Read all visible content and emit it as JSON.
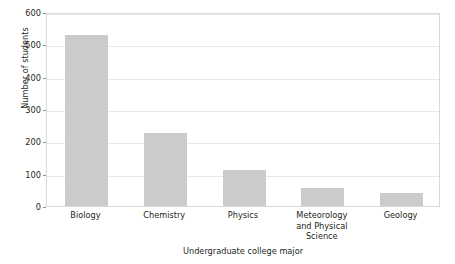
{
  "chart_data": {
    "type": "bar",
    "title": "",
    "xlabel": "Undergraduate college major",
    "ylabel": "Number of students",
    "categories": [
      "Biology",
      "Chemistry",
      "Physics",
      "Meteorology and Physical Science",
      "Geology"
    ],
    "category_lines": [
      [
        "Biology"
      ],
      [
        "Chemistry"
      ],
      [
        "Physics"
      ],
      [
        "Meteorology",
        "and Physical",
        "Science"
      ],
      [
        "Geology"
      ]
    ],
    "values": [
      530,
      225,
      112,
      56,
      40
    ],
    "ylim": [
      0,
      600
    ],
    "yticks": [
      0,
      100,
      200,
      300,
      400,
      500,
      600
    ],
    "ytick_labels": [
      "0",
      "100",
      "200",
      "300",
      "400",
      "500",
      "600"
    ],
    "grid": true,
    "legend": false,
    "bar_color": "#cbcbcb",
    "axis_color": "#d9d9d9",
    "grid_color": "#e8e8e8",
    "text_color": "#231f20"
  }
}
